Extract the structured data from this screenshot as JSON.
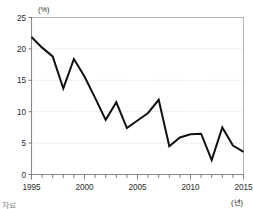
{
  "chart_data": {
    "type": "line",
    "title": "",
    "xlabel": "(년)",
    "ylabel": "(%)",
    "x": [
      1995,
      1996,
      1997,
      1998,
      1999,
      2000,
      2001,
      2002,
      2003,
      2004,
      2005,
      2006,
      2007,
      2008,
      2009,
      2010,
      2011,
      2012,
      2013,
      2014,
      2015
    ],
    "values": [
      21.9,
      20.2,
      18.8,
      13.7,
      18.4,
      15.6,
      12.2,
      8.7,
      11.5,
      7.4,
      8.6,
      9.8,
      11.9,
      4.5,
      5.9,
      6.4,
      6.5,
      2.3,
      7.5,
      4.6,
      3.6
    ],
    "series": [
      {
        "name": "series-1",
        "values": [
          21.9,
          20.2,
          18.8,
          13.7,
          18.4,
          15.6,
          12.2,
          8.7,
          11.5,
          7.4,
          8.6,
          9.8,
          11.9,
          4.5,
          5.9,
          6.4,
          6.5,
          2.3,
          7.5,
          4.6,
          3.6
        ]
      }
    ],
    "xlim": [
      1995,
      2015
    ],
    "ylim": [
      0,
      25
    ],
    "yticks": [
      0,
      5,
      10,
      15,
      20,
      25
    ],
    "ytick_labels": [
      "0",
      "5",
      "10",
      "15",
      "20",
      "25"
    ],
    "xticks": [
      1995,
      2000,
      2005,
      2010,
      2015
    ],
    "xtick_labels": [
      "1995",
      "2000",
      "2005",
      "2010",
      "2015"
    ],
    "xtick_minor_step": 1,
    "grid": true,
    "grid_axis": "y",
    "legend": false,
    "legend_position": "none",
    "line_color": "#111111",
    "grid_color": "#c8c8c8",
    "axis_color": "#8a8a8a",
    "background": "#ffffff"
  },
  "footer": {
    "fragment": "자료"
  }
}
